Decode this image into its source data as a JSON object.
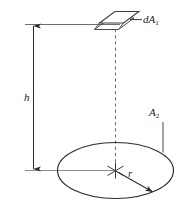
{
  "figure": {
    "kind": "geometry-diagram",
    "background_color": "#ffffff",
    "line_color": "#2b2b2b",
    "rule_color": "#8a8a8a",
    "dashed_color": "#6e6e6e",
    "labels": {
      "dA1": {
        "base": "dA",
        "sub": "1",
        "x": 143,
        "y": 14
      },
      "A2": {
        "base": "A",
        "sub": "2",
        "x": 149,
        "y": 107
      },
      "h": {
        "base": "h",
        "sub": "",
        "x": 24,
        "y": 92
      },
      "r": {
        "base": "r",
        "sub": "",
        "x": 128,
        "y": 168
      }
    },
    "elements": {
      "top_rule": "horizontal reference line at top through dA1 plane",
      "bottom_rule": "horizontal reference line at base through disk center",
      "height_dimension": "double-headed vertical arrow labelled h",
      "axis": "vertical dashed centerline from dA1 down to disk center",
      "patch": "small parallelogram representing dA1",
      "disk": "ellipse representing circular area A2",
      "radius_arrow": "arrow from disk center to disk rim labelled r",
      "center_mark": "asterisk cross marking disk center",
      "leader_dA1": "leader line from patch to dA1 label",
      "leader_A2": "vertical leader line from A2 label to disk rim"
    }
  }
}
